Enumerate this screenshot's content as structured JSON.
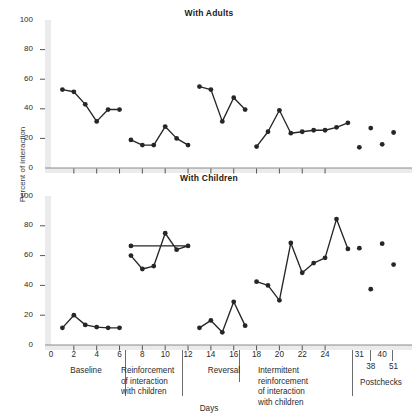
{
  "figure": {
    "ylabel": "Percent of interaction",
    "xlabel": "Days",
    "panels": [
      {
        "id": "adults",
        "title": "With Adults"
      },
      {
        "id": "children",
        "title": "With Children"
      }
    ]
  },
  "axes": {
    "y_ticks": [
      "0",
      "20",
      "40",
      "60",
      "80",
      "100"
    ],
    "y_values": [
      0,
      20,
      40,
      60,
      80,
      100
    ],
    "x_ticks_main": [
      "0",
      "2",
      "4",
      "6",
      "8",
      "10",
      "12",
      "14",
      "16",
      "18",
      "20",
      "22",
      "24"
    ],
    "x_ticks_post_top": [
      "31",
      "40"
    ],
    "x_ticks_post_bottom": [
      "38",
      "51"
    ]
  },
  "phases": [
    {
      "name": "Baseline",
      "label": "Baseline"
    },
    {
      "name": "reinforcement",
      "label": "Reinforcement\nof interaction\nwith children"
    },
    {
      "name": "reversal",
      "label": "Reversal"
    },
    {
      "name": "intermittent",
      "label": "Intermittent\nreinforcement\nof interaction\nwith children"
    },
    {
      "name": "postchecks",
      "label": "Postchecks"
    }
  ],
  "chart_data": {
    "type": "line",
    "xlabel": "Days",
    "ylabel": "Percent of interaction",
    "xlim": [
      0,
      28
    ],
    "ylim": [
      0,
      100
    ],
    "grid": false,
    "legend": "none",
    "panels": [
      {
        "title": "With Adults",
        "series": [
          {
            "name": "Baseline",
            "x": [
              1,
              2,
              3,
              4,
              5,
              6
            ],
            "values": [
              53,
              51.5,
              43,
              31.5,
              39.5,
              39.5
            ],
            "connected": true
          },
          {
            "name": "Reinforcement of interaction with children",
            "x": [
              7,
              8,
              9,
              10,
              11,
              12
            ],
            "values": [
              19,
              15.5,
              15.5,
              28,
              20,
              15.5
            ],
            "connected": true
          },
          {
            "name": "Reversal",
            "x": [
              13,
              14,
              15,
              16,
              17
            ],
            "values": [
              55,
              53,
              31.5,
              47.5,
              39.5
            ],
            "connected": true
          },
          {
            "name": "Intermittent reinforcement of interaction with children",
            "x": [
              18,
              19,
              20,
              21,
              22,
              23,
              24,
              25,
              26
            ],
            "values": [
              14.5,
              24.5,
              39,
              23.5,
              24.5,
              25.5,
              25.5,
              27.5,
              30.5
            ],
            "connected": true
          },
          {
            "name": "Postchecks",
            "x": [
              27,
              28,
              29,
              30
            ],
            "values": [
              14,
              27,
              16,
              24
            ],
            "connected": false
          }
        ]
      },
      {
        "title": "With Children",
        "series": [
          {
            "name": "Baseline",
            "x": [
              1,
              2,
              3,
              4,
              5,
              6
            ],
            "values": [
              11.5,
              20,
              13.5,
              12,
              11.5,
              11.5
            ],
            "connected": true
          },
          {
            "name": "Reinforcement of interaction with children",
            "x": [
              7,
              8,
              9,
              10,
              11,
              12
            ],
            "values": [
              60,
              51,
              53,
              75,
              64,
              66.5,
              66.5
            ],
            "connected": true
          },
          {
            "name": "Reversal",
            "x": [
              13,
              14,
              15,
              16,
              17
            ],
            "values": [
              11.5,
              16.5,
              8.5,
              29,
              13
            ],
            "connected": true
          },
          {
            "name": "Intermittent reinforcement of interaction with children",
            "x": [
              18,
              19,
              20,
              21,
              22,
              23,
              24,
              25,
              26
            ],
            "values": [
              42.5,
              40,
              30,
              68.5,
              48.5,
              55,
              58.5,
              84.5,
              64.5
            ],
            "connected": true
          },
          {
            "name": "Postchecks",
            "x": [
              27,
              28,
              29,
              30
            ],
            "values": [
              65,
              37.5,
              68,
              54
            ],
            "connected": false
          }
        ]
      }
    ]
  }
}
